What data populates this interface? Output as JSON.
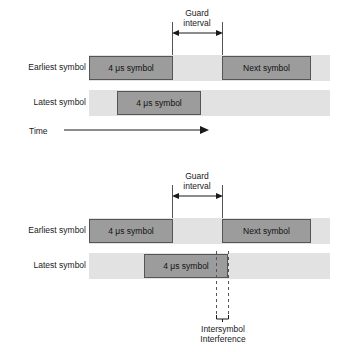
{
  "figure": {
    "colors": {
      "band": "#e2e2e2",
      "symbol_fill": "#9c9c9c",
      "symbol_border": "#555555",
      "line": "#1a1a1a",
      "dashed_line": "#555555",
      "background": "#ffffff"
    }
  },
  "panels": [
    {
      "id": "panel-no-isi",
      "guard_label_line1": "Guard",
      "guard_label_line2": "interval",
      "rows": [
        {
          "label": "Earliest symbol",
          "blocks": [
            {
              "text": "4 μs symbol"
            },
            {
              "text": "Next symbol"
            }
          ]
        },
        {
          "label": "Latest symbol",
          "blocks": [
            {
              "text": "4 μs symbol"
            }
          ]
        }
      ],
      "time_axis": {
        "label": "Time"
      }
    },
    {
      "id": "panel-with-isi",
      "guard_label_line1": "Guard",
      "guard_label_line2": "interval",
      "rows": [
        {
          "label": "Earliest symbol",
          "blocks": [
            {
              "text": "4 μs symbol"
            },
            {
              "text": "Next symbol"
            }
          ]
        },
        {
          "label": "Latest symbol",
          "blocks": [
            {
              "text": "4 μs symbol"
            }
          ]
        }
      ],
      "isi_label_line1": "Intersymbol",
      "isi_label_line2": "Interference"
    }
  ]
}
